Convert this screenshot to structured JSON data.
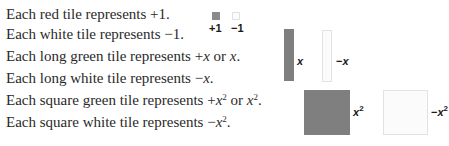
{
  "lines": [
    {
      "prefix": "Each red tile represents ",
      "value": "+1."
    },
    {
      "prefix": "Each white tile represents ",
      "value": "−1."
    },
    {
      "prefix": "Each long green tile represents ",
      "a": "+",
      "av": "x",
      "mid": " or ",
      "bv": "x",
      "end": "."
    },
    {
      "prefix": "Each long white tile represents ",
      "a": "−",
      "av": "x",
      "end": "."
    },
    {
      "prefix": "Each square green tile represents ",
      "a": "+",
      "av": "x",
      "exp": "2",
      "mid": " or ",
      "bv": "x",
      "exp2": "2",
      "end": "."
    },
    {
      "prefix": "Each square white tile represents ",
      "a": "−",
      "av": "x",
      "exp": "2",
      "end": "."
    }
  ],
  "tiles": {
    "unit_pos": {
      "color": "red",
      "label": "+1"
    },
    "unit_neg": {
      "color": "white",
      "label": "−1"
    },
    "long_pos": {
      "color": "green",
      "var": "x"
    },
    "long_neg": {
      "color": "white",
      "sign": "−",
      "var": "x"
    },
    "square_pos": {
      "color": "green",
      "var": "x",
      "exp": "2"
    },
    "square_neg": {
      "color": "white",
      "sign": "−",
      "var": "x",
      "exp": "2"
    }
  },
  "colors": {
    "red_tile": "#8a8a8a",
    "green_tile": "#7f7f7f",
    "white_tile": "#fbfbfb"
  }
}
